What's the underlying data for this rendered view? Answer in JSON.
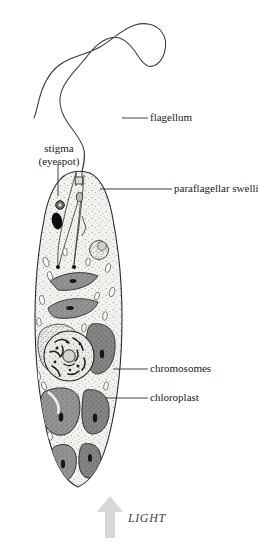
{
  "figure": {
    "background_color": "#ffffff",
    "line_color": "#262626",
    "cytoplasm_color": "#f2f1ee",
    "chloroplast_color": "#8d8d8d",
    "chloroplast_dark_color": "#6f6f6f",
    "pyrenoid_color": "#1c1c1c",
    "stigma_color": "#111111",
    "granule_color": "#fbfbfa",
    "arrow_color": "#d5d5d5"
  },
  "labels": {
    "flagellum": "flagellum",
    "stigma_line1": "stigma",
    "stigma_line2": "(eyespot)",
    "paraflagellar_swelling": "paraflagellar swelling",
    "chromosomes": "chromosomes",
    "chloroplast": "chloroplast",
    "light": "LIGHT"
  },
  "structures": [
    {
      "name": "flagellum",
      "description": "long wavy whip extending from anterior reservoir, looping up and to the left"
    },
    {
      "name": "stigma",
      "description": "dark pigmented eyespot near anterior left of reservoir"
    },
    {
      "name": "paraflagellar-swelling",
      "description": "small swelling at base of flagellum inside the reservoir"
    },
    {
      "name": "reservoir",
      "description": "funnel shaped invagination at the anterior end"
    },
    {
      "name": "nucleus",
      "description": "large round nucleus in mid-body containing chromosomes"
    },
    {
      "name": "chromosomes",
      "description": "condensed dark strands inside the nucleus"
    },
    {
      "name": "chloroplast",
      "description": "grey lobed plastids distributed through the cytoplasm, each with a dark pyrenoid"
    },
    {
      "name": "paramylon-granules",
      "description": "small pale rod shaped storage bodies scattered in cytoplasm"
    },
    {
      "name": "pellicle",
      "description": "outer boundary of the elongated spindle shaped cell"
    }
  ],
  "light_arrow": {
    "direction": "up",
    "meaning": "light source direction from below"
  }
}
